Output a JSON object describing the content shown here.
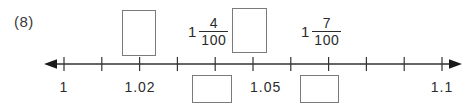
{
  "worksheet": {
    "problem_number": "(8)",
    "number_line": {
      "start_value": "1",
      "end_value": "1.1",
      "step": "0.01",
      "tick_count": 11,
      "left_arrow": "left-arrow",
      "right_arrow": "right-arrow",
      "axis_color": "#333333",
      "box_border_color": "#7a7a7a"
    },
    "tick_labels": [
      {
        "text": "1",
        "tick_index": 0
      },
      {
        "text": "1.02",
        "tick_index": 2
      },
      {
        "text": "1.05",
        "tick_index": 5
      },
      {
        "text": "1.1",
        "tick_index": 10
      }
    ],
    "mixed_numbers": [
      {
        "whole": "1",
        "numerator": "4",
        "denominator": "100"
      },
      {
        "whole": "1",
        "numerator": "7",
        "denominator": "100"
      }
    ],
    "answer_boxes": [
      {
        "id": "answer-box-above-1",
        "position": "above"
      },
      {
        "id": "answer-box-above-2",
        "position": "above"
      },
      {
        "id": "answer-box-below-1",
        "position": "below"
      },
      {
        "id": "answer-box-below-2",
        "position": "below"
      }
    ]
  }
}
